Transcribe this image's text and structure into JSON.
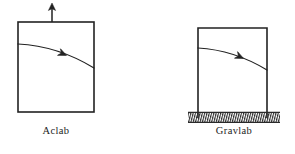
{
  "figure": {
    "background_color": "#ffffff",
    "ink_color": "#222222",
    "panels": [
      {
        "id": "aclab",
        "label": "Aclab",
        "box": {
          "x": 18,
          "y": 22,
          "width": 76,
          "height": 90,
          "closed_bottom": true,
          "stroke_width": 1.6
        },
        "acceleration_arrow": {
          "name": "acceleration-arrow",
          "direction": "up",
          "x": 52,
          "y_tail": 22,
          "y_head": 4,
          "head_width": 7,
          "head_length": 6
        },
        "trajectory": {
          "name": "projectile-path",
          "start": {
            "x": 18,
            "y": 44
          },
          "control": {
            "x": 58,
            "y": 46
          },
          "end": {
            "x": 94,
            "y": 68
          },
          "arrowhead_t": 0.58,
          "arrowhead_size": 7.5
        },
        "ground": null
      },
      {
        "id": "gravlab",
        "label": "Gravlab",
        "box": {
          "x": 198,
          "y": 28,
          "width": 69,
          "height": 86,
          "closed_bottom": false,
          "stroke_width": 1.6
        },
        "acceleration_arrow": null,
        "trajectory": {
          "name": "projectile-path",
          "start": {
            "x": 198,
            "y": 48
          },
          "control": {
            "x": 234,
            "y": 50
          },
          "end": {
            "x": 267,
            "y": 70
          },
          "arrowhead_t": 0.58,
          "arrowhead_size": 7.5
        },
        "ground": {
          "name": "hatched-ground",
          "x": 188,
          "y": 112,
          "width": 92,
          "height": 11,
          "hatch_spacing": 1.15,
          "hatch_color": "#2a2a2a"
        }
      }
    ]
  }
}
